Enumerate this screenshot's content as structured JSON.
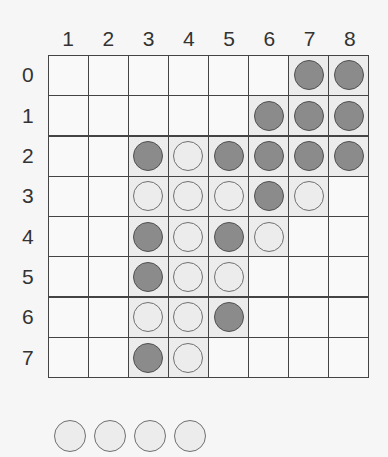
{
  "columns": [
    "1",
    "2",
    "3",
    "4",
    "5",
    "6",
    "7",
    "8"
  ],
  "rows": [
    "0",
    "1",
    "2",
    "3",
    "4",
    "5",
    "6",
    "7"
  ],
  "colors": {
    "dark_piece": "#8b8b8b",
    "light_piece": "#ececec",
    "grid_line": "#444444"
  },
  "board": [
    [
      "",
      "",
      "",
      "",
      "",
      "",
      "D",
      "D"
    ],
    [
      "",
      "",
      "",
      "",
      "",
      "D",
      "D",
      "D"
    ],
    [
      "",
      "",
      "D",
      "L",
      "D",
      "D",
      "D",
      "D"
    ],
    [
      "",
      "",
      "L",
      "L",
      "L",
      "D",
      "L",
      ""
    ],
    [
      "",
      "",
      "D",
      "L",
      "D",
      "L",
      "",
      ""
    ],
    [
      "",
      "",
      "D",
      "L",
      "L",
      "",
      "",
      ""
    ],
    [
      "",
      "",
      "L",
      "L",
      "D",
      "",
      "",
      ""
    ],
    [
      "",
      "",
      "D",
      "L",
      "",
      "",
      "",
      ""
    ]
  ],
  "reserve": [
    "L",
    "L",
    "L",
    "L"
  ]
}
